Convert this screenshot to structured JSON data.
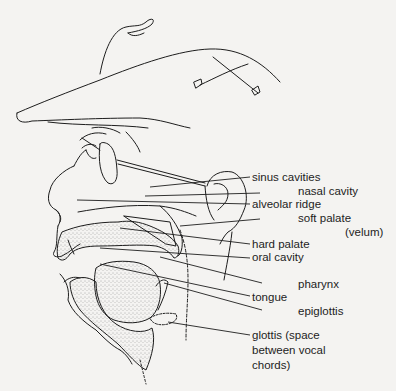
{
  "diagram": {
    "title": "",
    "labels": [
      {
        "id": "sinus",
        "text": "sinus cavities"
      },
      {
        "id": "nasal",
        "text": "nasal cavity"
      },
      {
        "id": "alveolar",
        "text": "alveolar ridge"
      },
      {
        "id": "soft_palate",
        "text": "soft palate"
      },
      {
        "id": "velum",
        "text": "(velum)"
      },
      {
        "id": "hard_palate",
        "text": "hard palate"
      },
      {
        "id": "oral",
        "text": "oral cavity"
      },
      {
        "id": "pharynx",
        "text": "pharynx"
      },
      {
        "id": "tongue",
        "text": "tongue"
      },
      {
        "id": "epiglottis",
        "text": "epiglottis"
      },
      {
        "id": "glottis_1",
        "text": "glottis (space"
      },
      {
        "id": "glottis_2",
        "text": "between vocal"
      },
      {
        "id": "glottis_3",
        "text": "chords)"
      }
    ],
    "colors": {
      "background": "#f4f3f1",
      "ink": "#1d1d1d",
      "stipple": "#555555"
    }
  }
}
